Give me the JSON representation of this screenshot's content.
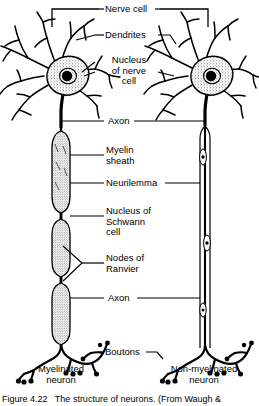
{
  "figure": {
    "caption": "Figure 4.22   The structure of neurons. (From Waugh &",
    "bracket_label": "Nerve cell"
  },
  "labels": {
    "nerve_cell": "Nerve cell",
    "dendrites": "Dendrites",
    "nucleus_of_nerve_cell": "Nucleus\nof nerve\ncell",
    "axon_top": "Axon",
    "myelin_sheath": "Myelin\nsheath",
    "neurilemma": "Neurilemma",
    "nucleus_of_schwann_cell": "Nucleus of\nSchwann\ncell",
    "nodes_of_ranvier": "Nodes of\nRanvier",
    "axon_bottom": "Axon",
    "boutons": "Boutons",
    "myelinated_neuron": "Myelinated\nneuron",
    "non_myelinated_neuron": "Non-myelinated\nneuron"
  },
  "colors": {
    "ink": "#000000",
    "background": "#ffffff",
    "stipple": "#6b6b6b",
    "myelin_fill": "#d8d8d8"
  },
  "diagram": {
    "left_neuron": "myelinated-neuron",
    "right_neuron": "non-myelinated-neuron"
  }
}
